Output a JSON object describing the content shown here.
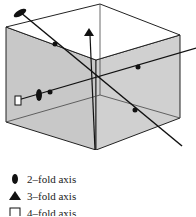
{
  "diagram": {
    "face_color": "#c8c8c8",
    "edge_color": "#222222"
  },
  "legend": {
    "items": [
      {
        "symbol": "ellipse",
        "label": "2–fold axis"
      },
      {
        "symbol": "triangle",
        "label": "3–fold axis"
      },
      {
        "symbol": "square",
        "label": "4–fold axis"
      }
    ]
  }
}
